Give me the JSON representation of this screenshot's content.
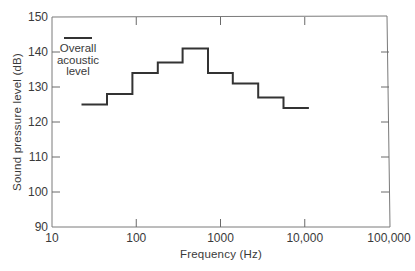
{
  "chart_data": {
    "type": "line",
    "subtype": "step (octave-band spectrum)",
    "title": "",
    "xlabel": "Frequency (Hz)",
    "ylabel": "Sound pressure level (dB)",
    "xscale": "log",
    "xlim": [
      10,
      100000
    ],
    "ylim": [
      90,
      150
    ],
    "x_ticks": [
      10,
      100,
      1000,
      10000,
      100000
    ],
    "x_tick_labels": [
      "10",
      "100",
      "1000",
      "10,000",
      "100,000"
    ],
    "y_ticks": [
      90,
      100,
      110,
      120,
      130,
      140,
      150
    ],
    "y_tick_labels": [
      "90",
      "100",
      "110",
      "120",
      "130",
      "140",
      "150"
    ],
    "grid": false,
    "series": [
      {
        "name": "Octave band levels",
        "band_edges_hz": [
          22.4,
          45,
          90,
          180,
          355,
          710,
          1400,
          2800,
          5600,
          11200
        ],
        "band_centers_hz": [
          31.5,
          63,
          125,
          250,
          500,
          1000,
          2000,
          4000,
          8000
        ],
        "values": [
          125,
          128,
          134,
          137,
          141,
          134,
          131,
          127,
          124
        ]
      }
    ],
    "legend": {
      "position": "upper-left",
      "entries": [
        {
          "label_lines": [
            "Overall",
            "acoustic",
            "level"
          ],
          "value": 144
        }
      ]
    }
  }
}
